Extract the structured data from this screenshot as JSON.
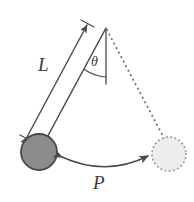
{
  "figure": {
    "type": "physics-diagram",
    "background_color": "#ffffff",
    "stroke_color": "#4a4a4a",
    "labels": {
      "length": "L",
      "angle": "θ",
      "period_path": "P"
    },
    "geometry": {
      "pivot": {
        "x": 106,
        "y": 28
      },
      "bob_rest": {
        "x": 169,
        "y": 154
      },
      "bob_displaced": {
        "x": 39,
        "y": 152
      },
      "bob_radius": 18,
      "ghost_bob_radius": 17,
      "vertical_line_end": {
        "x": 106,
        "y": 84
      },
      "angle_arc_degrees": 28
    },
    "elements": {
      "rod_label": "L",
      "angle_label": "θ",
      "swing_arrow_label": "P",
      "bob_fill": "#8c8c8c",
      "bob_stroke": "#4a4a4a",
      "ghost_bob_fill": "#ededed",
      "ghost_bob_stroke": "#9a9a9a",
      "dashed_rod_style": "dotted",
      "swing_arrow_style": "double-headed-curve"
    }
  }
}
